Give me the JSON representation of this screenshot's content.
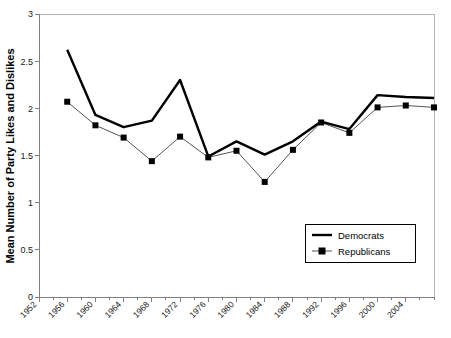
{
  "chart_data": {
    "type": "line",
    "title": "",
    "xlabel": "",
    "ylabel": "Mean Number of Party Likes and Dislikes",
    "ylim": [
      0,
      3
    ],
    "ytick_values": [
      0,
      0.5,
      1,
      1.5,
      2,
      2.5,
      3
    ],
    "ytick_labels": [
      "0",
      "0.5",
      "1",
      "1.5",
      "2",
      "2.5",
      "3"
    ],
    "xlim": [
      1952,
      2008
    ],
    "xtick_labels": [
      "1952",
      "1956",
      "1960",
      "1964",
      "1968",
      "1972",
      "1976",
      "1980",
      "1984",
      "1988",
      "1992",
      "1996",
      "2000",
      "2004"
    ],
    "xtick_values": [
      1952,
      1956,
      1960,
      1964,
      1968,
      1972,
      1976,
      1980,
      1984,
      1988,
      1992,
      1996,
      2000,
      2004
    ],
    "minor_tick_interval": 2,
    "grid": false,
    "legend_position": "inside-bottom-right",
    "x": [
      1956,
      1960,
      1964,
      1968,
      1972,
      1976,
      1980,
      1984,
      1988,
      1992,
      1996,
      2000,
      2004,
      2008
    ],
    "series": [
      {
        "name": "Democrats",
        "marker": "none",
        "color": "#000000",
        "linewidth": "thick",
        "values": [
          2.62,
          1.93,
          1.8,
          1.87,
          2.3,
          1.49,
          1.65,
          1.51,
          1.65,
          1.86,
          1.78,
          2.14,
          2.12,
          2.11
        ]
      },
      {
        "name": "Republicans",
        "marker": "square",
        "color": "#000000",
        "linewidth": "thin",
        "values": [
          2.07,
          1.82,
          1.69,
          1.44,
          1.7,
          1.48,
          1.55,
          1.22,
          1.56,
          1.85,
          1.74,
          2.01,
          2.03,
          2.01
        ]
      }
    ]
  },
  "legend": {
    "entries": [
      {
        "label": "Democrats"
      },
      {
        "label": "Republicans"
      }
    ]
  },
  "axes": {
    "y_title": "Mean Number of Party Likes and Dislikes"
  }
}
